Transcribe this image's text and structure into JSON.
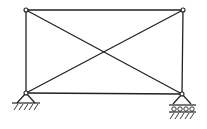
{
  "diagram": {
    "type": "truss-structure",
    "colors": {
      "line": "#222222",
      "background": "#ffffff",
      "node_fill": "#ffffff"
    },
    "nodes": [
      {
        "id": "top-left",
        "x": 26,
        "y": 10
      },
      {
        "id": "top-right",
        "x": 183,
        "y": 10
      },
      {
        "id": "bottom-left",
        "x": 26,
        "y": 93
      },
      {
        "id": "bottom-right",
        "x": 182,
        "y": 94
      }
    ],
    "members": [
      {
        "id": "top-chord",
        "from": "top-left",
        "to": "top-right"
      },
      {
        "id": "bottom-chord",
        "from": "bottom-left",
        "to": "bottom-right"
      },
      {
        "id": "left-post",
        "from": "top-left",
        "to": "bottom-left"
      },
      {
        "id": "right-post",
        "from": "top-right",
        "to": "bottom-right"
      },
      {
        "id": "diagonal-1",
        "from": "top-left",
        "to": "bottom-right"
      },
      {
        "id": "diagonal-2",
        "from": "bottom-left",
        "to": "top-right"
      }
    ],
    "supports": [
      {
        "id": "pin-support",
        "node": "bottom-left",
        "kind": "pinned"
      },
      {
        "id": "roller-support",
        "node": "bottom-right",
        "kind": "roller"
      }
    ]
  }
}
